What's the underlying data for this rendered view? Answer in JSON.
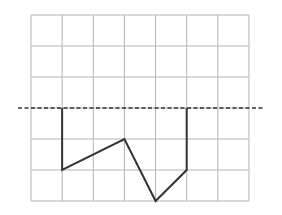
{
  "diagram": {
    "type": "grid-with-polyline",
    "grid": {
      "columns": 7,
      "rows": 6,
      "origin_px": [
        31,
        15
      ],
      "cell_px": [
        31.14,
        31
      ],
      "line_color": "#b4b4b4"
    },
    "axis_of_symmetry": {
      "style": "dashed",
      "row_line": 3,
      "x_start_px": 18,
      "x_end_px": 264,
      "color": "#333333"
    },
    "polyline": {
      "color": "#333333",
      "points_grid": [
        [
          1,
          3
        ],
        [
          1,
          5
        ],
        [
          3,
          4
        ],
        [
          4,
          6
        ],
        [
          5,
          5
        ],
        [
          5,
          3
        ]
      ]
    }
  }
}
